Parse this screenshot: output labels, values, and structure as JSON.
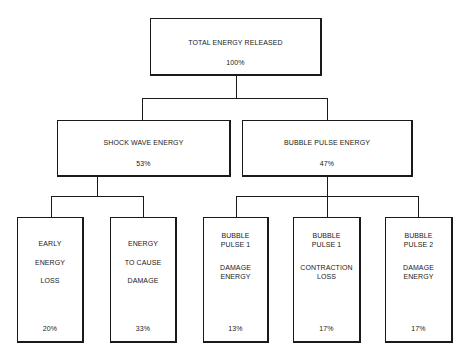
{
  "root": {
    "title": "TOTAL ENERGY RELEASED",
    "percent": "100%"
  },
  "level2": [
    {
      "title": "SHOCK WAVE ENERGY",
      "percent": "53%"
    },
    {
      "title": "BUBBLE PULSE ENERGY",
      "percent": "47%"
    }
  ],
  "level3": [
    {
      "lines": [
        "EARLY",
        "ENERGY",
        "LOSS"
      ],
      "percent": "20%",
      "parent": "SHOCK WAVE ENERGY"
    },
    {
      "lines": [
        "ENERGY",
        "TO CAUSE",
        "DAMAGE"
      ],
      "percent": "33%",
      "parent": "SHOCK WAVE ENERGY"
    },
    {
      "lines": [
        "BUBBLE",
        "PULSE 1",
        "DAMAGE",
        "ENERGY"
      ],
      "percent": "13%",
      "parent": "BUBBLE PULSE ENERGY"
    },
    {
      "lines": [
        "BUBBLE",
        "PULSE 1",
        "CONTRACTION",
        "LOSS"
      ],
      "percent": "17%",
      "parent": "BUBBLE PULSE ENERGY"
    },
    {
      "lines": [
        "BUBBLE",
        "PULSE 2",
        "DAMAGE",
        "ENERGY"
      ],
      "percent": "17%",
      "parent": "BUBBLE PULSE ENERGY"
    }
  ]
}
